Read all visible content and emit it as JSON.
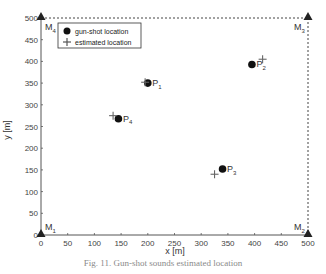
{
  "chart_data": {
    "type": "scatter",
    "title": "",
    "xlabel": "x [m]",
    "ylabel": "y [m]",
    "xlim": [
      0,
      500
    ],
    "ylim": [
      0,
      500
    ],
    "xticks": [
      0,
      50,
      100,
      150,
      200,
      250,
      300,
      350,
      400,
      450,
      500
    ],
    "yticks": [
      0,
      50,
      100,
      150,
      200,
      250,
      300,
      350,
      400,
      450,
      500
    ],
    "grid": false,
    "legend_position": "upper left",
    "series": [
      {
        "name": "gun-shot location",
        "marker": "filled-circle",
        "points": [
          {
            "label": "P1",
            "x": 200,
            "y": 350
          },
          {
            "label": "P2",
            "x": 395,
            "y": 393
          },
          {
            "label": "P3",
            "x": 340,
            "y": 152
          },
          {
            "label": "P4",
            "x": 145,
            "y": 268
          }
        ]
      },
      {
        "name": "estimated location",
        "marker": "plus",
        "points": [
          {
            "label": "P1",
            "x": 195,
            "y": 352
          },
          {
            "label": "P2",
            "x": 415,
            "y": 405
          },
          {
            "label": "P3",
            "x": 325,
            "y": 140
          },
          {
            "label": "P4",
            "x": 135,
            "y": 275
          }
        ]
      },
      {
        "name": "microphones",
        "marker": "filled-triangle",
        "points": [
          {
            "label": "M1",
            "x": 0,
            "y": 0
          },
          {
            "label": "M2",
            "x": 500,
            "y": 0
          },
          {
            "label": "M3",
            "x": 500,
            "y": 500
          },
          {
            "label": "M4",
            "x": 0,
            "y": 500
          }
        ]
      }
    ],
    "annotations": [
      "M1",
      "M2",
      "M3",
      "M4",
      "P1",
      "P2",
      "P3",
      "P4"
    ],
    "caption": "Fig. 11. Gun-shot sounds estimated location"
  },
  "legend": {
    "item1": "gun-shot location",
    "item2": "estimated location"
  },
  "axes": {
    "xlabel": "x [m]",
    "ylabel": "y [m]"
  },
  "caption": "Fig. 11. Gun-shot sounds estimated location"
}
